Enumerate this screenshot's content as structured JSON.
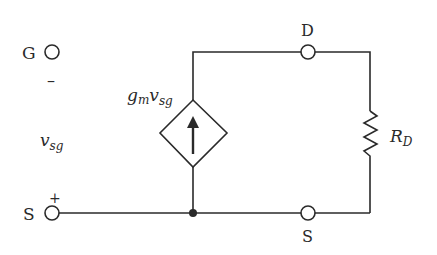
{
  "diagram": {
    "type": "small-signal equivalent circuit (p-channel MOSFET)",
    "terminals": {
      "gate": {
        "label": "G"
      },
      "source_left": {
        "label": "S",
        "polarity": "+"
      },
      "drain": {
        "label": "D"
      },
      "source_right": {
        "label": "S"
      }
    },
    "control_voltage": {
      "symbol": "v",
      "subscript": "sg",
      "top_polarity": "–",
      "bottom_polarity": "+"
    },
    "dependent_source": {
      "type": "voltage-controlled current source",
      "label_g": "g",
      "label_g_sub": "m",
      "label_v": "v",
      "label_v_sub": "sg",
      "direction": "up"
    },
    "resistor": {
      "symbol": "R",
      "subscript": "D"
    },
    "colors": {
      "line": "#2a2a2a",
      "background": "#ffffff"
    }
  }
}
